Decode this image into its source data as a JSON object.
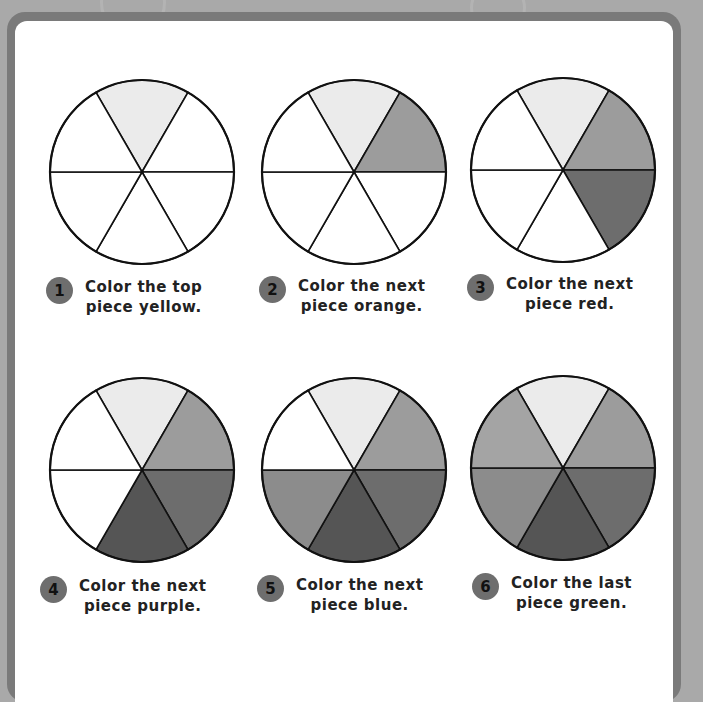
{
  "colors": {
    "background": "#a9a9a9",
    "frame": "#7a7a7a",
    "panel": "#ffffff",
    "badge": "#6e6e6e",
    "outline": "#111111",
    "empty": "#ffffff"
  },
  "slice_fills": [
    "#ebebeb",
    "#9c9c9c",
    "#6d6d6d",
    "#555555",
    "#8c8c8c",
    "#a4a4a4"
  ],
  "steps": [
    {
      "number": "1",
      "line1": "Color the top",
      "line2": "piece yellow.",
      "filled": 1
    },
    {
      "number": "2",
      "line1": "Color the next",
      "line2": "piece orange.",
      "filled": 2
    },
    {
      "number": "3",
      "line1": "Color the next",
      "line2": "piece red.",
      "filled": 3
    },
    {
      "number": "4",
      "line1": "Color the next",
      "line2": "piece purple.",
      "filled": 4
    },
    {
      "number": "5",
      "line1": "Color the next",
      "line2": "piece blue.",
      "filled": 5
    },
    {
      "number": "6",
      "line1": "Color the last",
      "line2": "piece green.",
      "filled": 6
    }
  ]
}
